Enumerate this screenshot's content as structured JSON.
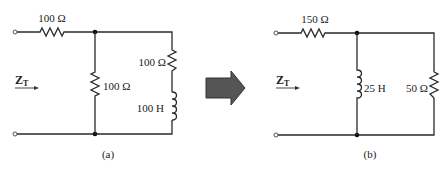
{
  "figure": {
    "arrow_color": "#555555",
    "wire_color": "#2a2a2a"
  },
  "circuit_a": {
    "caption": "(a)",
    "input_label": "Z",
    "input_label_sub": "T",
    "series_resistor": {
      "value": "100 Ω"
    },
    "shunt_resistor": {
      "value": "100 Ω"
    },
    "branch_resistor": {
      "value": "100 Ω"
    },
    "branch_inductor": {
      "value": "100 H"
    }
  },
  "circuit_b": {
    "caption": "(b)",
    "input_label": "Z",
    "input_label_sub": "T",
    "series_resistor": {
      "value": "150 Ω"
    },
    "shunt_inductor": {
      "value": "25 H"
    },
    "shunt_resistor": {
      "value": "50 Ω"
    }
  }
}
